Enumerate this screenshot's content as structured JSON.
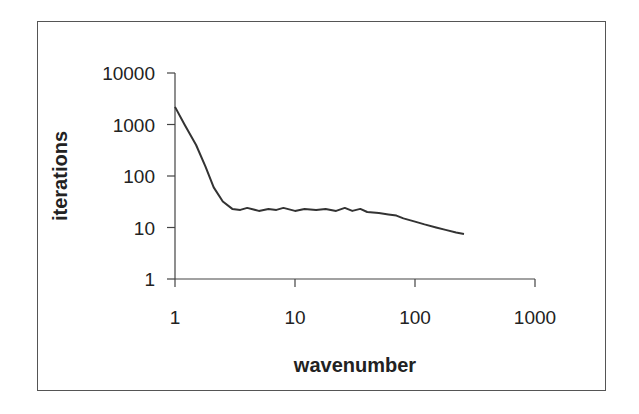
{
  "chart_data": {
    "type": "line",
    "title": "",
    "xlabel": "wavenumber",
    "ylabel": "iterations",
    "xscale": "log",
    "yscale": "log",
    "xlim": [
      1,
      1000
    ],
    "ylim": [
      1,
      10000
    ],
    "xticks": [
      "1",
      "10",
      "100",
      "1000"
    ],
    "yticks": [
      "10000",
      "1000",
      "100",
      "10",
      "1"
    ],
    "grid": false,
    "legend": null,
    "series": [
      {
        "name": "iterations",
        "color": "#333333",
        "x": [
          1,
          1.2,
          1.5,
          1.8,
          2.1,
          2.5,
          3.0,
          3.5,
          4,
          5,
          6,
          7,
          8,
          10,
          12,
          15,
          18,
          22,
          26,
          30,
          35,
          40,
          50,
          60,
          70,
          80,
          100,
          120,
          150,
          180,
          220,
          256
        ],
        "y": [
          2200,
          1000,
          400,
          150,
          60,
          32,
          23,
          22,
          24,
          21,
          23,
          22,
          24,
          21,
          23,
          22,
          23,
          21,
          24,
          21,
          23,
          20,
          19,
          18,
          17,
          15,
          13,
          11.5,
          10,
          9,
          8,
          7.5
        ]
      }
    ]
  }
}
